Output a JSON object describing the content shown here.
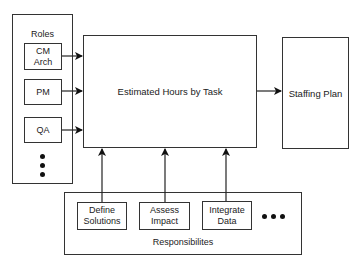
{
  "diagram": {
    "roles": {
      "title": "Roles",
      "items": [
        {
          "label": "CM\nArch"
        },
        {
          "label": "PM"
        },
        {
          "label": "QA"
        }
      ],
      "more": "ellipsis-vertical"
    },
    "center": {
      "label": "Estimated Hours by Task"
    },
    "output": {
      "label": "Staffing Plan"
    },
    "responsibilities": {
      "title": "Responsibilites",
      "items": [
        {
          "label": "Define\nSolutions"
        },
        {
          "label": "Assess\nImpact"
        },
        {
          "label": "Integrate\nData"
        }
      ],
      "more": "ellipsis-horizontal"
    },
    "colors": {
      "stroke": "#333333",
      "background": "#ffffff"
    }
  }
}
